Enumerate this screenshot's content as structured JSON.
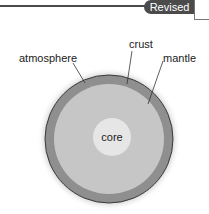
{
  "header": {
    "badge_label": "Revised",
    "badge_color": "#4b4b4b"
  },
  "diagram": {
    "layers": [
      {
        "name": "atmosphere",
        "label": "atmosphere",
        "color": "#e6e6e6"
      },
      {
        "name": "crust",
        "label": "crust",
        "color": "#8f8f8f"
      },
      {
        "name": "mantle",
        "label": "mantle",
        "color": "#c4c4c4"
      },
      {
        "name": "core",
        "label": "core",
        "color": "#e4e4e4"
      }
    ],
    "labels": {
      "atmosphere": "atmosphere",
      "crust": "crust",
      "mantle": "mantle",
      "core": "core"
    }
  }
}
